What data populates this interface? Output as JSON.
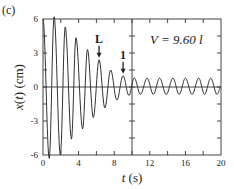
{
  "panel_label": "(c)",
  "annotation_V": "V = 9.60 l",
  "colors": {
    "line": "#333333",
    "axis": "#444444",
    "background": "#ffffff"
  },
  "chart_data": {
    "type": "line",
    "title": "",
    "panel": "(c)",
    "xlabel": "t (s)",
    "ylabel": "x(t) (cm)",
    "xlim": [
      0,
      20
    ],
    "ylim": [
      -6,
      6
    ],
    "xticks": [
      0,
      4,
      8,
      12,
      16,
      20
    ],
    "xtick_labels": [
      "0",
      "4",
      "8",
      "12",
      "16",
      "20"
    ],
    "x_minor_ticks": [
      2,
      6,
      10,
      14,
      18
    ],
    "yticks": [
      -6,
      -3,
      0,
      3,
      6
    ],
    "ytick_labels": [
      "-6",
      "-3",
      "0",
      "3",
      "6"
    ],
    "y_minor_ticks": [
      -4.5,
      -1.5,
      1.5,
      4.5
    ],
    "grid": false,
    "legend": null,
    "reference_lines": {
      "horizontal_zero": true,
      "vertical_at_t": 10
    },
    "annotations": [
      {
        "text": "L",
        "t": 6.3,
        "arrow_to_value": 2.4
      },
      {
        "text": "1",
        "t": 9.0,
        "arrow_to_value": 1.0
      },
      {
        "text": "V = 9.60 l",
        "t": 14.0,
        "value": 4.2
      }
    ],
    "series": [
      {
        "name": "x(t)",
        "description": "damped oscillation decaying to steady small-amplitude oscillation",
        "extrema": [
          {
            "t": 0.0,
            "x": 6.0
          },
          {
            "t": 0.7,
            "x": -6.3
          },
          {
            "t": 1.25,
            "x": 6.2
          },
          {
            "t": 1.95,
            "x": -6.0
          },
          {
            "t": 2.5,
            "x": 5.3
          },
          {
            "t": 3.2,
            "x": -4.6
          },
          {
            "t": 3.7,
            "x": 4.35
          },
          {
            "t": 4.45,
            "x": -3.7
          },
          {
            "t": 5.0,
            "x": 3.3
          },
          {
            "t": 5.65,
            "x": -2.7
          },
          {
            "t": 6.3,
            "x": 2.4
          },
          {
            "t": 6.95,
            "x": -1.85
          },
          {
            "t": 7.6,
            "x": 1.5
          },
          {
            "t": 8.3,
            "x": -1.15
          },
          {
            "t": 9.0,
            "x": 1.0
          },
          {
            "t": 9.65,
            "x": -0.75
          },
          {
            "t": 10.25,
            "x": 0.8
          },
          {
            "t": 10.95,
            "x": -0.65
          },
          {
            "t": 11.7,
            "x": 0.78
          },
          {
            "t": 12.4,
            "x": -0.65
          },
          {
            "t": 13.1,
            "x": 0.78
          },
          {
            "t": 13.85,
            "x": -0.65
          },
          {
            "t": 14.6,
            "x": 0.78
          },
          {
            "t": 15.3,
            "x": -0.65
          },
          {
            "t": 16.0,
            "x": 0.78
          },
          {
            "t": 16.75,
            "x": -0.65
          },
          {
            "t": 17.5,
            "x": 0.78
          },
          {
            "t": 18.15,
            "x": -0.65
          },
          {
            "t": 18.85,
            "x": 0.78
          },
          {
            "t": 19.55,
            "x": -0.65
          },
          {
            "t": 20.0,
            "x": 0.0
          }
        ]
      }
    ]
  }
}
